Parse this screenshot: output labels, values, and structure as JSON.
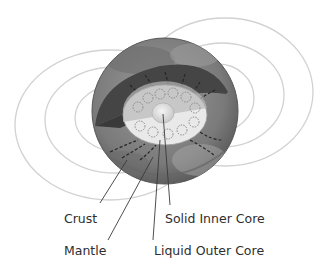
{
  "diagram": {
    "labels": {
      "crust": "Crust",
      "mantle": "Mantle",
      "solid_inner_core": "Solid Inner Core",
      "liquid_outer_core": "Liquid Outer Core"
    },
    "colors": {
      "field_lines": "#cfcfcf",
      "leader_lines": "#3a3a3a",
      "globe_light": "#8a8a8a",
      "globe_dark": "#3e3e3e",
      "mantle_band": "#4a4a4a",
      "outer_core": "#e6e6e6",
      "inner_core": "#d9d9d9",
      "text": "#2e2e2e"
    }
  }
}
